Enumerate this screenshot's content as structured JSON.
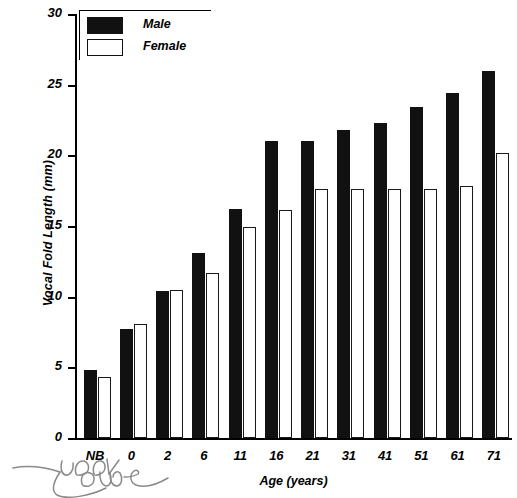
{
  "chart_data": {
    "type": "bar",
    "title": "",
    "xlabel": "Age (years)",
    "ylabel": "Vocal Fold Length (mm)",
    "categories": [
      "NB",
      "0",
      "2",
      "6",
      "11",
      "16",
      "21",
      "31",
      "41",
      "51",
      "61",
      "71"
    ],
    "ytick_labels": [
      "0",
      "5",
      "10",
      "15",
      "20",
      "25",
      "30"
    ],
    "yticks": [
      0,
      5,
      10,
      15,
      20,
      25,
      30
    ],
    "ylim": [
      0,
      30
    ],
    "grid": false,
    "legend_position": "top-left",
    "series": [
      {
        "name": "Male",
        "color": "#111111",
        "values": [
          4.8,
          7.7,
          10.4,
          13.1,
          16.2,
          21.0,
          21.0,
          21.8,
          22.3,
          23.4,
          24.4,
          26.0
        ]
      },
      {
        "name": "Female",
        "color": "#ffffff",
        "values": [
          4.3,
          8.1,
          10.5,
          11.7,
          14.9,
          16.1,
          17.6,
          17.6,
          17.6,
          17.6,
          17.8,
          20.2
        ]
      }
    ]
  },
  "annotation": {
    "handwriting": "look over"
  }
}
